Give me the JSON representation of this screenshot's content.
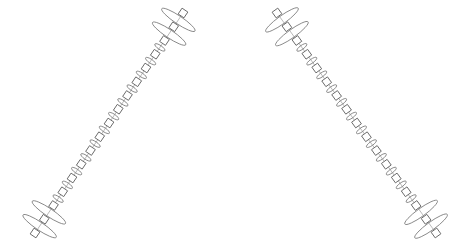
{
  "diagram": {
    "width": 471,
    "height": 248,
    "colors": {
      "stroke": "#6a6a6a",
      "ellipse": "#7a7a7a",
      "background": "#ffffff"
    },
    "chains": [
      {
        "name": "left-chain",
        "start": [
          35,
          233
        ],
        "end": [
          183,
          13
        ],
        "square_count": 17,
        "square_size": 7,
        "large_ellipse_slots": [
          0,
          1,
          14,
          15
        ],
        "large_ellipse": {
          "rx": 20,
          "ry": 4
        },
        "small_ellipse": {
          "rx": 6,
          "ry": 2
        }
      },
      {
        "name": "right-chain",
        "start": [
          277,
          13
        ],
        "end": [
          436,
          233
        ],
        "square_count": 17,
        "square_size": 7,
        "large_ellipse_slots": [
          0,
          1,
          14,
          15
        ],
        "large_ellipse": {
          "rx": 20,
          "ry": 4
        },
        "small_ellipse": {
          "rx": 6,
          "ry": 2
        }
      }
    ]
  }
}
